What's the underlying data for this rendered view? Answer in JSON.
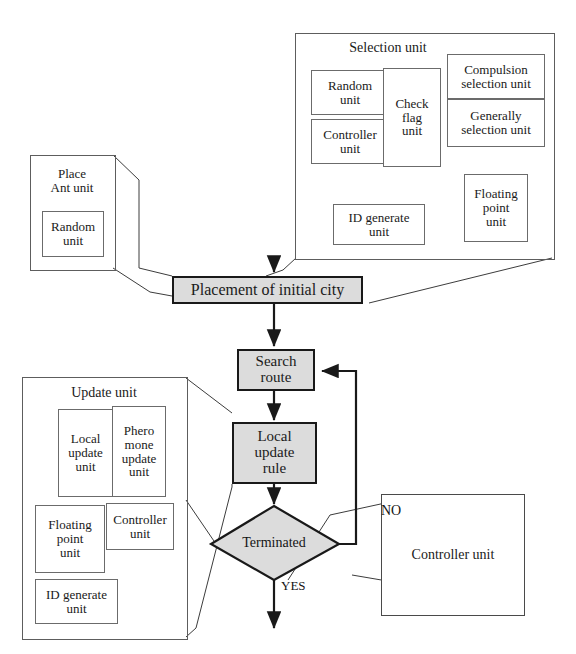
{
  "diagram": {
    "colors": {
      "process_fill": "#dcdcdc",
      "process_stroke": "#191919",
      "unit_stroke": "#6b6b6b",
      "connector": "#3c3c3c",
      "text": "#1a1a1a"
    },
    "groups": {
      "selection_unit": {
        "title": "Selection unit",
        "subunits": [
          {
            "id": "random",
            "label": "Random\nunit"
          },
          {
            "id": "controller",
            "label": "Controller\nunit"
          },
          {
            "id": "check_flag",
            "label": "Check\nflag\nunit"
          },
          {
            "id": "compulsion",
            "label": "Compulsion\nselection unit"
          },
          {
            "id": "generally",
            "label": "Generally\nselection unit"
          },
          {
            "id": "id_generate",
            "label": "ID generate\nunit"
          },
          {
            "id": "floating_point",
            "label": "Floating\npoint\nunit"
          }
        ]
      },
      "place_ant_unit": {
        "title": "Place\nAnt unit",
        "subunits": [
          {
            "id": "random",
            "label": "Random\nunit"
          }
        ]
      },
      "update_unit": {
        "title": "Update unit",
        "subunits": [
          {
            "id": "local_update",
            "label": "Local\nupdate\nunit"
          },
          {
            "id": "pheromone_update",
            "label": "Phero\nmone\nupdate\nunit"
          },
          {
            "id": "floating_point",
            "label": "Floating\npoint\nunit"
          },
          {
            "id": "controller",
            "label": "Controller\nunit"
          },
          {
            "id": "id_generate",
            "label": "ID generate\nunit"
          }
        ]
      },
      "controller_unit": {
        "title": "Controller unit"
      }
    },
    "flow": {
      "nodes": [
        {
          "id": "placement",
          "label": "Placement of initial city",
          "shape": "process"
        },
        {
          "id": "search",
          "label": "Search\nroute",
          "shape": "process"
        },
        {
          "id": "local_update_rule",
          "label": "Local\nupdate\nrule",
          "shape": "process"
        },
        {
          "id": "terminated",
          "label": "Terminated",
          "shape": "decision"
        }
      ],
      "edge_labels": {
        "no": "NO",
        "yes": "YES"
      }
    }
  }
}
